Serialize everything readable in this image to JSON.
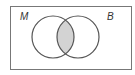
{
  "diagram": {
    "type": "venn",
    "universe": {
      "x": 10,
      "y": 6,
      "width": 122,
      "height": 64
    },
    "sets": [
      {
        "label": "M",
        "cx": 53,
        "cy": 37,
        "r": 21,
        "label_x": 20,
        "label_y": 20
      },
      {
        "label": "B",
        "cx": 78,
        "cy": 37,
        "r": 21,
        "label_x": 107,
        "label_y": 20
      }
    ],
    "shaded_region": "M ∩ B",
    "colors": {
      "stroke": "#555555",
      "shade": "#d3d3d3",
      "border": "#777777"
    }
  }
}
